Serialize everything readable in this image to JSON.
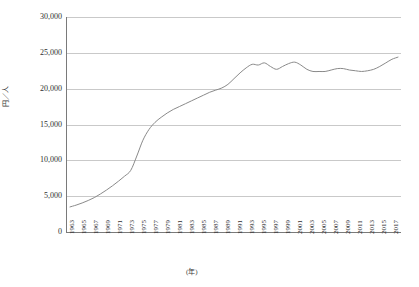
{
  "chart_data": {
    "type": "line",
    "title": "",
    "subtitle": "",
    "xlabel": "(年)",
    "ylabel": "円／人",
    "ylim": [
      0,
      30000
    ],
    "xlim": [
      1963,
      2017
    ],
    "grid": true,
    "legend": "none",
    "y_ticks": [
      {
        "value": 30000,
        "label": "30,000"
      },
      {
        "value": 25000,
        "label": "25,000"
      },
      {
        "value": 20000,
        "label": "20,000"
      },
      {
        "value": 15000,
        "label": "15,000"
      },
      {
        "value": 10000,
        "label": "10,000"
      },
      {
        "value": 5000,
        "label": "5,000"
      },
      {
        "value": 0,
        "label": "0"
      }
    ],
    "x_tick_labels": [
      "1963",
      "1965",
      "1967",
      "1969",
      "1971",
      "1973",
      "1975",
      "1977",
      "1979",
      "1981",
      "1983",
      "1985",
      "1987",
      "1989",
      "1991",
      "1993",
      "1995",
      "1997",
      "1999",
      "2001",
      "2003",
      "2005",
      "2007",
      "2009",
      "2011",
      "2013",
      "2015",
      "2017"
    ],
    "series": [
      {
        "name": "円／人",
        "color": "#8a8a8a",
        "x": [
          1963,
          1964,
          1965,
          1966,
          1967,
          1968,
          1969,
          1970,
          1971,
          1972,
          1973,
          1974,
          1975,
          1976,
          1977,
          1978,
          1979,
          1980,
          1981,
          1982,
          1983,
          1984,
          1985,
          1986,
          1987,
          1988,
          1989,
          1990,
          1991,
          1992,
          1993,
          1994,
          1995,
          1996,
          1997,
          1998,
          1999,
          2000,
          2001,
          2002,
          2003,
          2004,
          2005,
          2006,
          2007,
          2008,
          2009,
          2010,
          2011,
          2012,
          2013,
          2014,
          2015,
          2016,
          2017
        ],
        "values": [
          3500,
          3750,
          4050,
          4400,
          4800,
          5300,
          5850,
          6450,
          7100,
          7800,
          8600,
          10600,
          12800,
          14300,
          15300,
          16000,
          16600,
          17100,
          17500,
          17900,
          18300,
          18700,
          19100,
          19500,
          19800,
          20100,
          20600,
          21400,
          22200,
          22900,
          23400,
          23300,
          23600,
          23100,
          22700,
          23100,
          23500,
          23700,
          23300,
          22700,
          22400,
          22400,
          22400,
          22600,
          22800,
          22800,
          22600,
          22500,
          22400,
          22500,
          22700,
          23100,
          23600,
          24100,
          24400
        ]
      }
    ]
  },
  "axes": {
    "y_title": "円／人",
    "x_title": "(年)"
  }
}
